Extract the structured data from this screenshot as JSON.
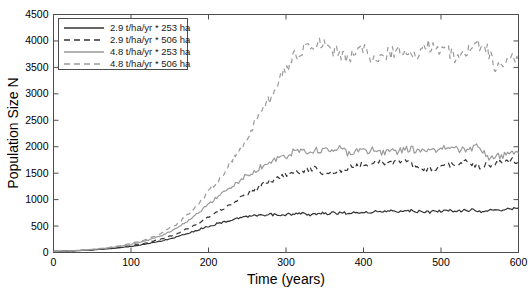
{
  "chart_data": {
    "type": "line",
    "title": "",
    "xlabel": "Time (years)",
    "ylabel": "Population Size N",
    "xlim": [
      0,
      600
    ],
    "ylim": [
      0,
      4500
    ],
    "xticks": [
      0,
      100,
      200,
      300,
      400,
      500,
      600
    ],
    "yticks": [
      0,
      500,
      1000,
      1500,
      2000,
      2500,
      3000,
      3500,
      4000,
      4500
    ],
    "xtick_labels": [
      "0",
      "100",
      "200",
      "300",
      "400",
      "500",
      "600"
    ],
    "ytick_labels": [
      "0",
      "500",
      "1000",
      "1500",
      "2000",
      "2500",
      "3000",
      "3500",
      "4000",
      "4500"
    ],
    "grid": false,
    "legend_position": "upper-left",
    "box": true,
    "series": [
      {
        "name": "2.9 t/ha/yr * 253 ha",
        "color": "#333333",
        "style": "solid",
        "x": [
          0,
          20,
          40,
          60,
          80,
          100,
          120,
          140,
          160,
          180,
          200,
          215,
          230,
          245,
          260,
          270,
          280,
          290,
          300,
          310,
          320,
          330,
          340,
          350,
          360,
          370,
          380,
          390,
          400,
          410,
          420,
          430,
          440,
          450,
          460,
          470,
          480,
          490,
          500,
          510,
          520,
          530,
          540,
          550,
          560,
          570,
          580,
          590,
          600
        ],
        "values": [
          20,
          28,
          40,
          58,
          82,
          115,
          160,
          222,
          300,
          395,
          500,
          560,
          615,
          660,
          700,
          705,
          720,
          700,
          715,
          725,
          735,
          715,
          730,
          740,
          748,
          752,
          745,
          755,
          760,
          768,
          772,
          778,
          782,
          788,
          792,
          772,
          760,
          772,
          780,
          788,
          792,
          796,
          800,
          780,
          790,
          800,
          812,
          822,
          835
        ]
      },
      {
        "name": "2.9 t/ha/yr * 506 ha",
        "color": "#333333",
        "style": "dashed",
        "x": [
          0,
          20,
          40,
          60,
          80,
          100,
          120,
          140,
          160,
          180,
          200,
          215,
          230,
          245,
          260,
          270,
          280,
          290,
          300,
          310,
          320,
          330,
          340,
          350,
          360,
          370,
          380,
          390,
          400,
          410,
          420,
          430,
          440,
          450,
          460,
          470,
          480,
          490,
          500,
          510,
          520,
          530,
          540,
          550,
          560,
          570,
          580,
          590,
          600
        ],
        "values": [
          20,
          28,
          42,
          62,
          90,
          128,
          182,
          258,
          360,
          500,
          680,
          800,
          930,
          1060,
          1190,
          1280,
          1350,
          1420,
          1450,
          1490,
          1540,
          1560,
          1590,
          1480,
          1520,
          1560,
          1610,
          1640,
          1665,
          1690,
          1705,
          1700,
          1710,
          1720,
          1730,
          1600,
          1560,
          1600,
          1630,
          1660,
          1680,
          1695,
          1700,
          1620,
          1650,
          1690,
          1710,
          1730,
          1750
        ]
      },
      {
        "name": "4.8 t/ha/yr * 253 ha",
        "color": "#9a9a9a",
        "style": "solid",
        "x": [
          0,
          20,
          40,
          60,
          80,
          100,
          120,
          140,
          160,
          180,
          200,
          215,
          230,
          245,
          260,
          270,
          280,
          290,
          300,
          310,
          320,
          330,
          340,
          350,
          360,
          370,
          380,
          390,
          400,
          410,
          420,
          430,
          440,
          450,
          460,
          470,
          480,
          490,
          500,
          510,
          520,
          530,
          540,
          550,
          560,
          570,
          580,
          590,
          600
        ],
        "values": [
          20,
          30,
          46,
          70,
          104,
          152,
          222,
          322,
          465,
          660,
          920,
          1090,
          1260,
          1410,
          1560,
          1630,
          1700,
          1790,
          1830,
          1900,
          1930,
          1900,
          1950,
          1930,
          1960,
          1980,
          1860,
          1900,
          1920,
          1940,
          1890,
          1920,
          1900,
          1940,
          1960,
          1900,
          1930,
          1950,
          1970,
          1990,
          1940,
          1960,
          1980,
          2000,
          1800,
          1820,
          1840,
          1855,
          1870
        ]
      },
      {
        "name": "4.8 t/ha/yr * 506 ha",
        "color": "#9a9a9a",
        "style": "dashed",
        "x": [
          0,
          20,
          40,
          60,
          80,
          100,
          120,
          140,
          160,
          180,
          200,
          215,
          230,
          245,
          260,
          270,
          280,
          290,
          300,
          310,
          320,
          330,
          340,
          350,
          360,
          370,
          380,
          390,
          400,
          410,
          420,
          430,
          440,
          450,
          460,
          470,
          480,
          490,
          500,
          510,
          520,
          530,
          540,
          550,
          560,
          570,
          580,
          590,
          600
        ],
        "values": [
          20,
          30,
          48,
          74,
          112,
          168,
          250,
          370,
          545,
          800,
          1160,
          1420,
          1720,
          2060,
          2430,
          2680,
          2940,
          3200,
          3460,
          3680,
          3820,
          3900,
          3960,
          3880,
          3830,
          3760,
          3700,
          3780,
          3860,
          3700,
          3660,
          3740,
          3820,
          3760,
          3700,
          3800,
          3880,
          3920,
          3860,
          3780,
          3700,
          3820,
          3900,
          3950,
          3860,
          3500,
          3560,
          3640,
          3700
        ]
      }
    ]
  },
  "legend": {
    "entries": [
      {
        "label": "2.9 t/ha/yr * 253 ha"
      },
      {
        "label": "2.9 t/ha/yr * 506 ha"
      },
      {
        "label": "4.8 t/ha/yr * 253 ha"
      },
      {
        "label": "4.8 t/ha/yr * 506 ha"
      }
    ]
  },
  "colors": {
    "dark_series": "#333333",
    "light_series": "#9a9a9a",
    "axis": "#4d4d4d",
    "background": "#ffffff"
  }
}
